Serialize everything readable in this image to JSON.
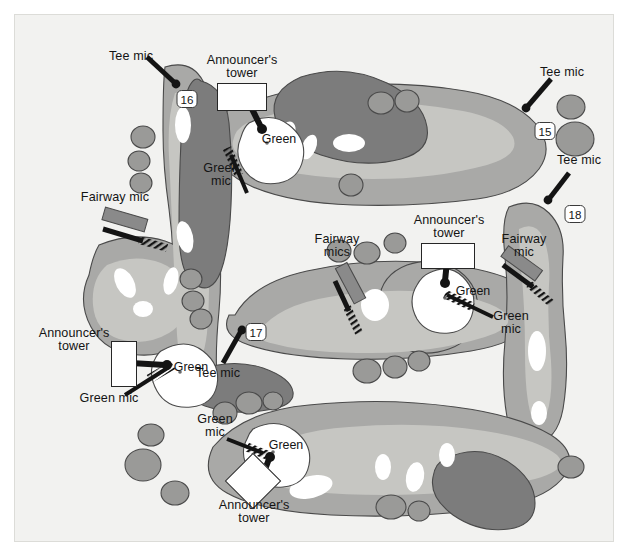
{
  "figure": {
    "kind": "golf-course-microphone-placement-map",
    "background_color": "#f2f2f0",
    "border_color": "#dcdcd8"
  },
  "palette": {
    "background": "#f2f2f0",
    "rough": "#a9a9a7",
    "fairway": "#c6c6c2",
    "green_fill": "#ffffff",
    "bunker": "#ffffff",
    "trees": "#7c7c7c",
    "outline": "#4a4a4a",
    "ink": "#141414",
    "mic_body": "#8a8a8a"
  },
  "legend_terms": {
    "tee_mic": "Tee mic",
    "green_mic": "Green mic",
    "fairway_mic": "Fairway mic",
    "fairway_mics": "Fairway mics",
    "announcers_tower": "Announcer's tower",
    "green": "Green"
  },
  "holes": [
    {
      "id": "hole-15",
      "number": "15"
    },
    {
      "id": "hole-16",
      "number": "16"
    },
    {
      "id": "hole-17",
      "number": "17"
    },
    {
      "id": "hole-18",
      "number": "18"
    }
  ],
  "green_labels": [
    {
      "id": "green-16",
      "text": "Green"
    },
    {
      "id": "green-17",
      "text": "Green"
    },
    {
      "id": "green-18",
      "text": "Green"
    },
    {
      "id": "green-15",
      "text": "Green"
    }
  ],
  "labels": [
    {
      "id": "tee-mic-16",
      "text": "Tee mic"
    },
    {
      "id": "tee-mic-15",
      "text": "Tee mic"
    },
    {
      "id": "tee-mic-18",
      "text": "Tee mic"
    },
    {
      "id": "tee-mic-17",
      "text": "Tee mic"
    },
    {
      "id": "fairway-mic-16",
      "text": "Fairway mic"
    },
    {
      "id": "fairway-mics-18",
      "text": "Fairway\nmics"
    },
    {
      "id": "fairway-mic-18",
      "text": "Fairway\nmic"
    },
    {
      "id": "green-mic-16",
      "text": "Green\nmic"
    },
    {
      "id": "green-mic-17",
      "text": "Green mic"
    },
    {
      "id": "green-mic-18",
      "text": "Green\nmic"
    },
    {
      "id": "green-mic-15",
      "text": "Green\nmic"
    },
    {
      "id": "tower-16",
      "text": "Announcer's\ntower"
    },
    {
      "id": "tower-17",
      "text": "Announcer's\ntower"
    },
    {
      "id": "tower-18",
      "text": "Announcer's\ntower"
    },
    {
      "id": "tower-15",
      "text": "Announcer's\ntower"
    }
  ],
  "counts": {
    "tee_mics": 4,
    "green_mics": 4,
    "fairway_mic_groups": 3,
    "announcers_towers": 4
  }
}
